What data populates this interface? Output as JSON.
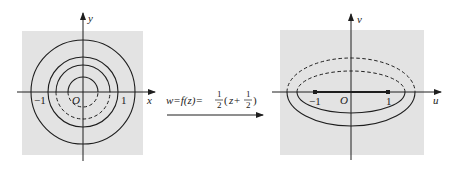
{
  "diagram": {
    "colors": {
      "background": "#ffffff",
      "panel_fill": "#e3e3e3",
      "stroke": "#1e1e1e"
    },
    "z_plane": {
      "x_axis_label": "x",
      "y_axis_label": "y",
      "origin_label": "O",
      "tick_neg_one": "−1",
      "tick_one": "1",
      "circles": [
        {
          "radius_px": 52,
          "style": "solid"
        },
        {
          "radius_px": 35,
          "style": "solid"
        },
        {
          "radius_px": 27,
          "style": "solid upper / dashed lower"
        },
        {
          "radius_px": 15,
          "style": "solid upper / dashed lower"
        }
      ]
    },
    "mapping": {
      "lhs": "w=f(z)=",
      "frac1_num": "1",
      "frac1_den": "2",
      "paren_open": "(",
      "z_plus": "z+",
      "frac2_num": "1",
      "frac2_den": "2",
      "paren_close": ")",
      "arrow": "→"
    },
    "w_plane": {
      "u_axis_label": "u",
      "v_axis_label": "v",
      "origin_label": "O",
      "tick_neg_one": "−1",
      "tick_one": "1",
      "ellipses": [
        {
          "a_px": 64,
          "b_px": 34,
          "style": "dashed upper / solid lower"
        },
        {
          "a_px": 54,
          "b_px": 21,
          "style": "dashed upper / solid lower"
        }
      ],
      "segment": "[-1, 1] on u-axis"
    }
  }
}
